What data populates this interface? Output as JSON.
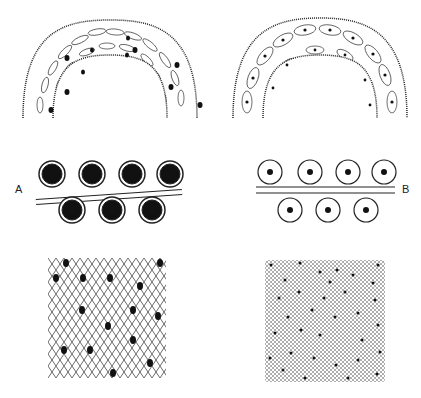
{
  "figure": {
    "labels": {
      "left": "A",
      "right": "B"
    },
    "colors": {
      "ink": "#222222",
      "fill": "#1a1a1a",
      "background": "#ffffff",
      "mesh": "#555555"
    },
    "panels": [
      {
        "id": "arch-left",
        "description": "arched tissue band with elongated cells and dark nuclei"
      },
      {
        "id": "arch-right",
        "description": "arched tissue band with larger spindle cells and small dot nuclei"
      },
      {
        "id": "loops-left",
        "description": "chain of 7 alternating loops with filled dark centers",
        "label": "A"
      },
      {
        "id": "loops-right",
        "description": "chain of 7 alternating loops with small dot centers",
        "label": "B"
      },
      {
        "id": "mesh-left",
        "description": "coarse diamond lattice with scattered dark oval spots"
      },
      {
        "id": "mesh-right",
        "description": "fine checkered lattice with scattered small dots"
      }
    ]
  }
}
